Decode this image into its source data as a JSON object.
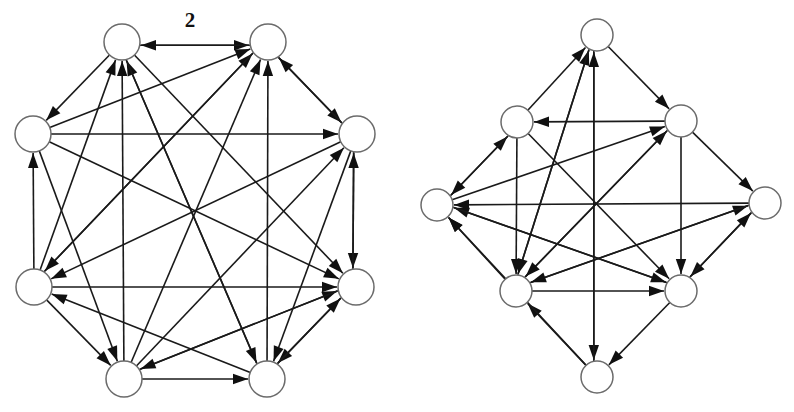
{
  "figure": {
    "type": "diagram",
    "background_color": "#ffffff",
    "edge_color": "#1a1a1a",
    "arrow_color": "#101010",
    "node_fill": "#ffffff",
    "node_stroke": "#6b6b6b",
    "labels": [
      {
        "text": "2",
        "x": 190,
        "y": 22
      }
    ],
    "graphs": [
      {
        "name": "left-graph",
        "node_radius": 18,
        "nodes": [
          {
            "id": "L0",
            "x": 122,
            "y": 42
          },
          {
            "id": "L1",
            "x": 268,
            "y": 42
          },
          {
            "id": "L2",
            "x": 357,
            "y": 134
          },
          {
            "id": "L3",
            "x": 356,
            "y": 287
          },
          {
            "id": "L4",
            "x": 267,
            "y": 379
          },
          {
            "id": "L5",
            "x": 124,
            "y": 379
          },
          {
            "id": "L6",
            "x": 34,
            "y": 287
          },
          {
            "id": "L7",
            "x": 33,
            "y": 134
          }
        ],
        "edges": [
          {
            "from": "L0",
            "to": "L1"
          },
          {
            "from": "L0",
            "to": "L7"
          },
          {
            "from": "L1",
            "to": "L2"
          },
          {
            "from": "L1",
            "to": "L0"
          },
          {
            "from": "L2",
            "to": "L3"
          },
          {
            "from": "L2",
            "to": "L1"
          },
          {
            "from": "L3",
            "to": "L4"
          },
          {
            "from": "L3",
            "to": "L2"
          },
          {
            "from": "L4",
            "to": "L0"
          },
          {
            "from": "L4",
            "to": "L1"
          },
          {
            "from": "L4",
            "to": "L3"
          },
          {
            "from": "L5",
            "to": "L0"
          },
          {
            "from": "L5",
            "to": "L1"
          },
          {
            "from": "L5",
            "to": "L2"
          },
          {
            "from": "L5",
            "to": "L3"
          },
          {
            "from": "L5",
            "to": "L4"
          },
          {
            "from": "L6",
            "to": "L0"
          },
          {
            "from": "L6",
            "to": "L1"
          },
          {
            "from": "L6",
            "to": "L3"
          },
          {
            "from": "L6",
            "to": "L5"
          },
          {
            "from": "L6",
            "to": "L7"
          },
          {
            "from": "L7",
            "to": "L1"
          },
          {
            "from": "L7",
            "to": "L2"
          },
          {
            "from": "L7",
            "to": "L3"
          },
          {
            "from": "L7",
            "to": "L5"
          },
          {
            "from": "L3",
            "to": "L5"
          },
          {
            "from": "L2",
            "to": "L4"
          },
          {
            "from": "L2",
            "to": "L6"
          },
          {
            "from": "L1",
            "to": "L6"
          },
          {
            "from": "L4",
            "to": "L6"
          },
          {
            "from": "L0",
            "to": "L3"
          },
          {
            "from": "L0",
            "to": "L4"
          }
        ]
      },
      {
        "name": "right-graph",
        "node_radius": 16,
        "nodes": [
          {
            "id": "R0",
            "x": 597,
            "y": 35
          },
          {
            "id": "R1",
            "x": 681,
            "y": 121
          },
          {
            "id": "R2",
            "x": 765,
            "y": 203
          },
          {
            "id": "R3",
            "x": 681,
            "y": 291
          },
          {
            "id": "R4",
            "x": 597,
            "y": 377
          },
          {
            "id": "R5",
            "x": 516,
            "y": 291
          },
          {
            "id": "R6",
            "x": 437,
            "y": 205
          },
          {
            "id": "R7",
            "x": 517,
            "y": 122
          }
        ],
        "edges": [
          {
            "from": "R0",
            "to": "R1"
          },
          {
            "from": "R0",
            "to": "R4"
          },
          {
            "from": "R1",
            "to": "R2"
          },
          {
            "from": "R1",
            "to": "R3"
          },
          {
            "from": "R1",
            "to": "R7"
          },
          {
            "from": "R2",
            "to": "R3"
          },
          {
            "from": "R3",
            "to": "R2"
          },
          {
            "from": "R3",
            "to": "R4"
          },
          {
            "from": "R4",
            "to": "R0"
          },
          {
            "from": "R4",
            "to": "R5"
          },
          {
            "from": "R5",
            "to": "R0"
          },
          {
            "from": "R5",
            "to": "R1"
          },
          {
            "from": "R5",
            "to": "R2"
          },
          {
            "from": "R5",
            "to": "R3"
          },
          {
            "from": "R5",
            "to": "R6"
          },
          {
            "from": "R6",
            "to": "R7"
          },
          {
            "from": "R6",
            "to": "R1"
          },
          {
            "from": "R7",
            "to": "R0"
          },
          {
            "from": "R7",
            "to": "R3"
          },
          {
            "from": "R7",
            "to": "R5"
          },
          {
            "from": "R2",
            "to": "R5"
          },
          {
            "from": "R1",
            "to": "R5"
          },
          {
            "from": "R3",
            "to": "R6"
          },
          {
            "from": "R4",
            "to": "R6"
          },
          {
            "from": "R0",
            "to": "R5"
          },
          {
            "from": "R7",
            "to": "R6"
          },
          {
            "from": "R6",
            "to": "R3"
          },
          {
            "from": "R2",
            "to": "R6"
          }
        ]
      }
    ]
  }
}
